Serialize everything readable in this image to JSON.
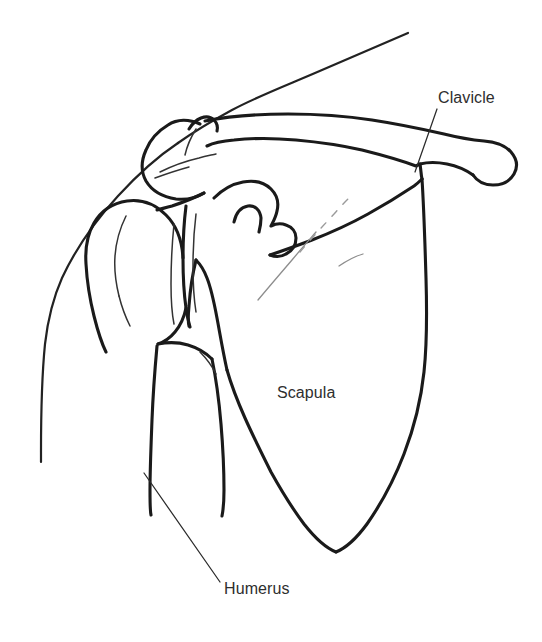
{
  "figure": {
    "kind": "anatomical-line-drawing",
    "background_color": "#ffffff",
    "stroke_color": "#1a1a1a",
    "label_color": "#2e2e2e"
  },
  "labels": {
    "clavicle": {
      "text": "Clavicle",
      "x": 438,
      "y": 103,
      "leader_from_x": 437,
      "leader_from_y": 109,
      "leader_to_x": 415,
      "leader_to_y": 172
    },
    "scapula": {
      "text": "Scapula",
      "x": 277,
      "y": 398
    },
    "humerus": {
      "text": "Humerus",
      "x": 224,
      "y": 594,
      "leader_from_x": 144,
      "leader_from_y": 473,
      "leader_to_x": 220,
      "leader_to_y": 582
    }
  },
  "structures": [
    {
      "name": "trapezius-neck-contour",
      "label": "Neck and trapezius contour"
    },
    {
      "name": "deltoid-arm-contour",
      "label": "Outer arm / deltoid contour"
    },
    {
      "name": "acromion",
      "label": "Acromion process"
    },
    {
      "name": "clavicle-bone",
      "label": "Clavicle"
    },
    {
      "name": "coracoid-process",
      "label": "Coracoid process"
    },
    {
      "name": "humeral-head",
      "label": "Head of the humerus"
    },
    {
      "name": "greater-tuberosity",
      "label": "Greater tuberosity"
    },
    {
      "name": "humeral-shaft",
      "label": "Shaft of the humerus"
    },
    {
      "name": "glenoid-cavity",
      "label": "Glenoid cavity"
    },
    {
      "name": "scapula-body",
      "label": "Body of the scapula"
    },
    {
      "name": "scapular-spine",
      "label": "Spine of the scapula"
    },
    {
      "name": "scapula-lateral-border",
      "label": "Lateral border of the scapula"
    },
    {
      "name": "scapula-inferior-angle",
      "label": "Inferior angle of the scapula"
    }
  ]
}
